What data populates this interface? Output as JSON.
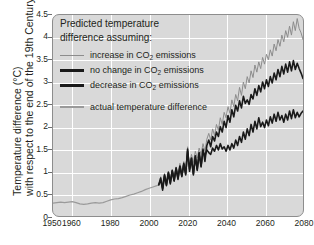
{
  "axes": {
    "ylabel_line1": "Temperature difference (°C)",
    "ylabel_line2": "with respect to the end of the 19th Century",
    "yticks": [
      "0",
      "0.5",
      "1",
      "1.5",
      "2",
      "2.5",
      "3",
      "3.5",
      "4",
      "4.5"
    ],
    "xticks": [
      "1950",
      "1960",
      "1980",
      "2000",
      "2020",
      "2040",
      "2060",
      "2080"
    ]
  },
  "legend": {
    "title_line1": "Predicted temperature",
    "title_line2": "difference assuming:",
    "items": [
      {
        "label_a": "increase in CO",
        "sub": "2",
        "label_b": " emissions",
        "swatch": "thin-gray"
      },
      {
        "label_a": "no change in CO",
        "sub": "2",
        "label_b": " emissions",
        "swatch": "thick-black"
      },
      {
        "label_a": "decrease in CO",
        "sub": "2",
        "label_b": " emissions",
        "swatch": "thick-black"
      },
      {
        "label_a": "actual temperature difference",
        "sub": "",
        "label_b": "",
        "swatch": "gray-act"
      }
    ]
  },
  "colors": {
    "plot_background": "#d9d9d9",
    "gridline": "#ffffff",
    "frame": "#8d8d8d",
    "increase_line": "#8c8c8c",
    "no_change_line": "#1a1a1a",
    "decrease_line": "#1a1a1a",
    "actual_line": "#9a9a9a",
    "text": "#231f20"
  },
  "chart_data": {
    "type": "line",
    "title": "",
    "xlabel": "",
    "ylabel": "Temperature difference (°C) with respect to the end of the 19th Century",
    "xlim": [
      1950,
      2080
    ],
    "ylim": [
      0,
      4.5
    ],
    "ytick_step": 0.5,
    "xtick_values": [
      1950,
      1960,
      1980,
      2000,
      2020,
      2040,
      2060,
      2080
    ],
    "grid": true,
    "legend_position": "upper-left-inside",
    "series": [
      {
        "name": "actual temperature difference",
        "color": "#9a9a9a",
        "width": 1.2,
        "x": [
          1950,
          1952,
          1954,
          1956,
          1958,
          1960,
          1962,
          1964,
          1966,
          1968,
          1970,
          1972,
          1974,
          1976,
          1978,
          1980,
          1982,
          1984,
          1986,
          1988,
          1990,
          1992,
          1994,
          1996,
          1998,
          2000,
          2002,
          2004,
          2005
        ],
        "y": [
          0.29,
          0.3,
          0.31,
          0.3,
          0.31,
          0.32,
          0.3,
          0.27,
          0.26,
          0.27,
          0.29,
          0.3,
          0.29,
          0.3,
          0.33,
          0.36,
          0.38,
          0.39,
          0.41,
          0.44,
          0.47,
          0.49,
          0.52,
          0.55,
          0.59,
          0.62,
          0.65,
          0.68,
          0.7
        ]
      },
      {
        "name": "increase in CO2 emissions",
        "color": "#8c8c8c",
        "width": 1.0,
        "x": [
          2005,
          2006,
          2007,
          2008,
          2009,
          2010,
          2011,
          2012,
          2013,
          2014,
          2015,
          2016,
          2017,
          2018,
          2019,
          2020,
          2021,
          2022,
          2023,
          2024,
          2025,
          2026,
          2027,
          2028,
          2029,
          2030,
          2031,
          2032,
          2033,
          2034,
          2035,
          2036,
          2037,
          2038,
          2039,
          2040,
          2041,
          2042,
          2043,
          2044,
          2045,
          2046,
          2047,
          2048,
          2049,
          2050,
          2051,
          2052,
          2053,
          2054,
          2055,
          2056,
          2057,
          2058,
          2059,
          2060,
          2061,
          2062,
          2063,
          2064,
          2065,
          2066,
          2067,
          2068,
          2069,
          2070,
          2071,
          2072,
          2073,
          2074,
          2075,
          2076,
          2077,
          2078,
          2079,
          2080
        ],
        "y": [
          0.7,
          0.88,
          0.72,
          0.95,
          0.78,
          1.0,
          0.84,
          1.05,
          0.9,
          1.1,
          0.95,
          1.18,
          1.0,
          1.22,
          1.05,
          1.55,
          1.12,
          1.38,
          1.2,
          1.45,
          1.3,
          1.52,
          1.38,
          1.62,
          1.45,
          1.72,
          1.85,
          1.7,
          1.95,
          1.8,
          2.05,
          1.92,
          2.2,
          2.05,
          2.32,
          2.2,
          2.45,
          2.3,
          2.6,
          2.45,
          2.72,
          2.58,
          2.88,
          2.7,
          3.0,
          2.85,
          3.12,
          2.98,
          3.25,
          3.1,
          3.38,
          3.22,
          3.45,
          3.3,
          3.55,
          3.4,
          3.62,
          3.5,
          3.72,
          3.58,
          3.85,
          3.7,
          3.95,
          3.8,
          4.05,
          3.9,
          4.15,
          4.0,
          4.25,
          4.05,
          4.35,
          4.15,
          4.42,
          4.2,
          4.1,
          3.95
        ]
      },
      {
        "name": "no change in CO2 emissions",
        "color": "#1a1a1a",
        "width": 1.6,
        "x": [
          2005,
          2006,
          2007,
          2008,
          2009,
          2010,
          2011,
          2012,
          2013,
          2014,
          2015,
          2016,
          2017,
          2018,
          2019,
          2020,
          2021,
          2022,
          2023,
          2024,
          2025,
          2026,
          2027,
          2028,
          2029,
          2030,
          2031,
          2032,
          2033,
          2034,
          2035,
          2036,
          2037,
          2038,
          2039,
          2040,
          2041,
          2042,
          2043,
          2044,
          2045,
          2046,
          2047,
          2048,
          2049,
          2050,
          2051,
          2052,
          2053,
          2054,
          2055,
          2056,
          2057,
          2058,
          2059,
          2060,
          2061,
          2062,
          2063,
          2064,
          2065,
          2066,
          2067,
          2068,
          2069,
          2070,
          2071,
          2072,
          2073,
          2074,
          2075,
          2076,
          2077,
          2078,
          2079,
          2080
        ],
        "y": [
          0.7,
          0.8,
          0.62,
          0.92,
          0.7,
          0.98,
          0.75,
          1.02,
          0.8,
          1.08,
          0.85,
          1.12,
          0.9,
          1.18,
          0.95,
          1.45,
          1.05,
          1.3,
          0.92,
          1.35,
          1.05,
          1.42,
          1.12,
          1.5,
          1.22,
          1.58,
          1.7,
          1.55,
          1.78,
          1.68,
          1.88,
          1.78,
          2.0,
          1.88,
          2.12,
          1.98,
          2.25,
          2.1,
          2.38,
          2.22,
          2.48,
          2.35,
          2.58,
          2.42,
          2.68,
          2.52,
          2.6,
          2.5,
          2.72,
          2.62,
          2.85,
          2.7,
          2.92,
          2.78,
          3.0,
          2.85,
          3.05,
          2.9,
          3.12,
          2.98,
          3.2,
          3.05,
          3.28,
          3.12,
          3.35,
          3.18,
          3.4,
          3.22,
          3.45,
          3.25,
          3.48,
          3.28,
          3.42,
          3.3,
          3.2,
          3.08
        ]
      },
      {
        "name": "decrease in CO2 emissions",
        "color": "#1a1a1a",
        "width": 1.6,
        "x": [
          2005,
          2006,
          2007,
          2008,
          2009,
          2010,
          2011,
          2012,
          2013,
          2014,
          2015,
          2016,
          2017,
          2018,
          2019,
          2020,
          2021,
          2022,
          2023,
          2024,
          2025,
          2026,
          2027,
          2028,
          2029,
          2030,
          2031,
          2032,
          2033,
          2034,
          2035,
          2036,
          2037,
          2038,
          2039,
          2040,
          2041,
          2042,
          2043,
          2044,
          2045,
          2046,
          2047,
          2048,
          2049,
          2050,
          2051,
          2052,
          2053,
          2054,
          2055,
          2056,
          2057,
          2058,
          2059,
          2060,
          2061,
          2062,
          2063,
          2064,
          2065,
          2066,
          2067,
          2068,
          2069,
          2070,
          2071,
          2072,
          2073,
          2074,
          2075,
          2076,
          2077,
          2078,
          2079,
          2080
        ],
        "y": [
          0.7,
          0.85,
          0.58,
          0.9,
          0.68,
          0.95,
          0.72,
          1.0,
          0.78,
          1.05,
          0.82,
          1.1,
          0.88,
          1.15,
          0.92,
          1.5,
          1.0,
          1.28,
          0.95,
          1.32,
          1.02,
          1.4,
          1.1,
          1.45,
          1.35,
          1.48,
          1.42,
          1.38,
          1.52,
          1.45,
          1.58,
          1.48,
          1.62,
          1.5,
          1.55,
          1.45,
          1.58,
          1.48,
          1.62,
          1.52,
          1.7,
          1.58,
          1.78,
          1.65,
          1.88,
          1.72,
          1.95,
          1.8,
          2.05,
          1.88,
          2.12,
          1.95,
          2.2,
          2.0,
          2.1,
          1.98,
          2.15,
          2.02,
          2.22,
          2.08,
          2.28,
          2.12,
          2.32,
          2.15,
          2.25,
          2.1,
          2.28,
          2.15,
          2.35,
          2.18,
          2.38,
          2.2,
          2.32,
          2.22,
          2.3,
          2.35
        ]
      }
    ]
  }
}
